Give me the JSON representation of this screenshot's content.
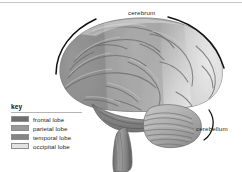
{
  "figure": {
    "background_color": "#ffffff",
    "top_rule_color": "#c8c8c8"
  },
  "annotations": {
    "cerebrum": {
      "label": "cerebrum",
      "bracket": "black arc above the cerebral hemisphere, broken at the label"
    },
    "cerebellum": {
      "label": "cerebellum",
      "leader": "curved black line from the label to the cerebellum"
    }
  },
  "legend": {
    "title": "key",
    "rule_color": "#b5b5b5",
    "items": [
      {
        "label": "frontal lobe",
        "color": "#6f6f6f"
      },
      {
        "label": "parietal lobe",
        "color": "#9a9a9a"
      },
      {
        "label": "temporal lobe",
        "color": "#858585"
      },
      {
        "label": "occipital lobe",
        "color": "#e2e2e2"
      }
    ]
  }
}
